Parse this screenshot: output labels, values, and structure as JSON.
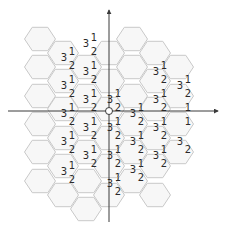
{
  "diagram": {
    "title": "",
    "colors": {
      "hex_fill": "#f7f7f7",
      "hex_stroke": "#c9c9c9",
      "axis": "#3a3a3a",
      "label": "#2a2a2a"
    },
    "geometry": {
      "hex_radius": 15.5,
      "col_spacing": 23.25,
      "row_spacing": 27,
      "origin": [
        109,
        111
      ]
    },
    "columns": [
      {
        "cx": 40,
        "rows": [
          39,
          67,
          96,
          124,
          152,
          181
        ]
      },
      {
        "cx": 63,
        "rows": [
          53,
          81,
          109,
          138,
          166,
          195
        ]
      },
      {
        "cx": 86,
        "rows": [
          67,
          96,
          124,
          152,
          181,
          209
        ]
      },
      {
        "cx": 109,
        "rows": [
          53,
          81,
          109,
          138,
          166,
          195
        ]
      },
      {
        "cx": 132,
        "rows": [
          39,
          67,
          96,
          124,
          152,
          181
        ]
      },
      {
        "cx": 155,
        "rows": [
          53,
          81,
          109,
          138,
          166,
          195
        ]
      },
      {
        "cx": 178,
        "rows": [
          67,
          96,
          124,
          152
        ]
      }
    ],
    "labels": [
      {
        "t": "3",
        "x": 64,
        "y": 58
      },
      {
        "t": "1",
        "x": 72,
        "y": 52
      },
      {
        "t": "2",
        "x": 72,
        "y": 66
      },
      {
        "t": "3",
        "x": 86,
        "y": 44
      },
      {
        "t": "1",
        "x": 94,
        "y": 38
      },
      {
        "t": "2",
        "x": 94,
        "y": 52
      },
      {
        "t": "3",
        "x": 64,
        "y": 86
      },
      {
        "t": "1",
        "x": 72,
        "y": 80
      },
      {
        "t": "2",
        "x": 72,
        "y": 94
      },
      {
        "t": "3",
        "x": 86,
        "y": 72
      },
      {
        "t": "1",
        "x": 94,
        "y": 66
      },
      {
        "t": "2",
        "x": 94,
        "y": 80
      },
      {
        "t": "3",
        "x": 86,
        "y": 100
      },
      {
        "t": "1",
        "x": 94,
        "y": 94
      },
      {
        "t": "2",
        "x": 94,
        "y": 108
      },
      {
        "t": "3",
        "x": 64,
        "y": 114
      },
      {
        "t": "1",
        "x": 72,
        "y": 108
      },
      {
        "t": "2",
        "x": 72,
        "y": 122
      },
      {
        "t": "3",
        "x": 86,
        "y": 128
      },
      {
        "t": "1",
        "x": 94,
        "y": 122
      },
      {
        "t": "2",
        "x": 94,
        "y": 136
      },
      {
        "t": "3",
        "x": 64,
        "y": 142
      },
      {
        "t": "1",
        "x": 72,
        "y": 136
      },
      {
        "t": "2",
        "x": 72,
        "y": 150
      },
      {
        "t": "3",
        "x": 86,
        "y": 156
      },
      {
        "t": "1",
        "x": 94,
        "y": 150
      },
      {
        "t": "2",
        "x": 94,
        "y": 164
      },
      {
        "t": "3",
        "x": 64,
        "y": 172
      },
      {
        "t": "1",
        "x": 72,
        "y": 166
      },
      {
        "t": "2",
        "x": 72,
        "y": 180
      },
      {
        "t": "3",
        "x": 110,
        "y": 100
      },
      {
        "t": "1",
        "x": 118,
        "y": 94
      },
      {
        "t": "2",
        "x": 118,
        "y": 108
      },
      {
        "t": "3",
        "x": 110,
        "y": 128
      },
      {
        "t": "1",
        "x": 118,
        "y": 122
      },
      {
        "t": "2",
        "x": 118,
        "y": 136
      },
      {
        "t": "3",
        "x": 110,
        "y": 156
      },
      {
        "t": "1",
        "x": 118,
        "y": 150
      },
      {
        "t": "2",
        "x": 118,
        "y": 164
      },
      {
        "t": "3",
        "x": 110,
        "y": 184
      },
      {
        "t": "1",
        "x": 118,
        "y": 178
      },
      {
        "t": "2",
        "x": 118,
        "y": 192
      },
      {
        "t": "3",
        "x": 133,
        "y": 114
      },
      {
        "t": "1",
        "x": 141,
        "y": 108
      },
      {
        "t": "2",
        "x": 141,
        "y": 122
      },
      {
        "t": "3",
        "x": 133,
        "y": 142
      },
      {
        "t": "1",
        "x": 141,
        "y": 136
      },
      {
        "t": "2",
        "x": 141,
        "y": 150
      },
      {
        "t": "3",
        "x": 133,
        "y": 170
      },
      {
        "t": "1",
        "x": 141,
        "y": 164
      },
      {
        "t": "2",
        "x": 141,
        "y": 178
      },
      {
        "t": "3",
        "x": 156,
        "y": 72
      },
      {
        "t": "1",
        "x": 164,
        "y": 66
      },
      {
        "t": "2",
        "x": 164,
        "y": 80
      },
      {
        "t": "3",
        "x": 156,
        "y": 100
      },
      {
        "t": "1",
        "x": 164,
        "y": 94
      },
      {
        "t": "2",
        "x": 164,
        "y": 108
      },
      {
        "t": "3",
        "x": 156,
        "y": 128
      },
      {
        "t": "1",
        "x": 164,
        "y": 122
      },
      {
        "t": "2",
        "x": 164,
        "y": 136
      },
      {
        "t": "3",
        "x": 156,
        "y": 156
      },
      {
        "t": "1",
        "x": 164,
        "y": 150
      },
      {
        "t": "2",
        "x": 164,
        "y": 164
      },
      {
        "t": "3",
        "x": 180,
        "y": 86
      },
      {
        "t": "1",
        "x": 188,
        "y": 80
      },
      {
        "t": "2",
        "x": 188,
        "y": 94
      },
      {
        "t": "1",
        "x": 188,
        "y": 108
      },
      {
        "t": "3",
        "x": 180,
        "y": 142
      },
      {
        "t": "1",
        "x": 188,
        "y": 122
      },
      {
        "t": "2",
        "x": 188,
        "y": 150
      }
    ],
    "axes": {
      "x": {
        "from": [
          8,
          111
        ],
        "to": [
          218,
          111
        ]
      },
      "y": {
        "from": [
          109,
          222
        ],
        "to": [
          109,
          10
        ]
      }
    }
  }
}
